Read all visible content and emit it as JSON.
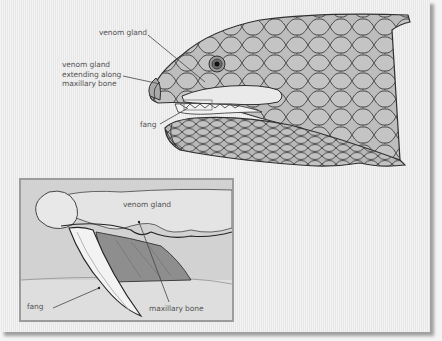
{
  "figure": {
    "main_view": {
      "subject": "snake head, lateral view",
      "labels": [
        {
          "id": "venom-gland",
          "text": "venom gland"
        },
        {
          "id": "venom-gland-extending",
          "lines": [
            "venom gland",
            "extending along",
            "maxillary bone"
          ]
        },
        {
          "id": "fang",
          "text": "fang"
        }
      ]
    },
    "inset_view": {
      "subject": "close-up of fang and venom gland",
      "labels": [
        {
          "id": "inset-venom-gland",
          "text": "venom gland"
        },
        {
          "id": "inset-fang",
          "text": "fang"
        },
        {
          "id": "inset-maxillary-bone",
          "text": "maxillary bone"
        }
      ]
    }
  },
  "colors": {
    "background": "#ececec",
    "scale_fill": "#bdbdbd",
    "scale_line": "#333333",
    "gland_fill": "#e8e8e8",
    "inset_fill": "#d2d2d2",
    "inset_border": "#9c9c9c",
    "maxillary_fill": "#8e8e8e",
    "label_text": "#555555"
  }
}
